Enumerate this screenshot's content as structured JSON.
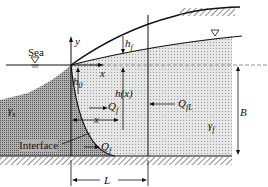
{
  "diagram": {
    "labels": {
      "sea": "Sea",
      "y_axis": "y",
      "x_axis": "x",
      "h_f": "h",
      "h_f_sub": "f",
      "h0": "h",
      "h0_sub": "0",
      "hx": "h(x)",
      "Qf": "Q",
      "Qf_sub": "f",
      "QfL": "Q",
      "QfL_sub": "fL",
      "x_dim": "x",
      "gamma_s": "γ",
      "gamma_s_sub": "s",
      "gamma_f": "γ",
      "gamma_f_sub": "f",
      "B": "B",
      "interface": "Interface",
      "Q_lower": "Q",
      "Q_lower_sub": "f",
      "L": "L"
    },
    "colors": {
      "line": "#111111",
      "freshwater_fill": "#d9d9d9",
      "saltwater_fill": "#9a9a9a",
      "background": "#ffffff"
    }
  }
}
